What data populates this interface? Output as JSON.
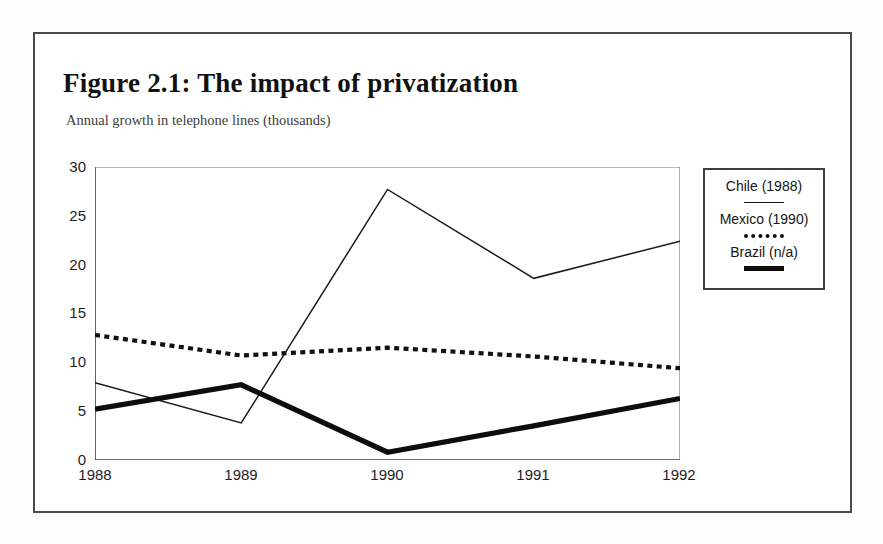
{
  "figure": {
    "title": "Figure 2.1:  The impact of privatization",
    "subtitle": "Annual growth in telephone lines (thousands)"
  },
  "legend": {
    "entries": [
      {
        "label": "Chile (1988)",
        "style": "thin-solid"
      },
      {
        "label": "Mexico (1990)",
        "style": "dotted"
      },
      {
        "label": "Brazil (n/a)",
        "style": "thick-solid"
      }
    ]
  },
  "axes": {
    "y_ticks": [
      "0",
      "5",
      "10",
      "15",
      "20",
      "25",
      "30"
    ],
    "x_ticks": [
      "1988",
      "1989",
      "1990",
      "1991",
      "1992"
    ]
  },
  "chart_data": {
    "type": "line",
    "title": "Figure 2.1:  The impact of privatization",
    "subtitle": "Annual growth in telephone lines (thousands)",
    "xlabel": "",
    "ylabel": "Annual growth in telephone lines (thousands)",
    "categories": [
      "1988",
      "1989",
      "1990",
      "1991",
      "1992"
    ],
    "x": [
      1988,
      1989,
      1990,
      1991,
      1992
    ],
    "ylim": [
      0,
      30
    ],
    "yticks": [
      0,
      5,
      10,
      15,
      20,
      25,
      30
    ],
    "grid": false,
    "legend_position": "right-outside",
    "series": [
      {
        "name": "Chile (1988)",
        "values": [
          7.9,
          3.8,
          27.7,
          18.6,
          22.4
        ],
        "line_style": "solid",
        "line_width": 1.4,
        "color": "#1a1a1a"
      },
      {
        "name": "Mexico (1990)",
        "values": [
          12.8,
          10.7,
          11.5,
          10.6,
          9.4
        ],
        "line_style": "dotted",
        "line_width": 4,
        "color": "#111111"
      },
      {
        "name": "Brazil (n/a)",
        "values": [
          5.2,
          7.7,
          0.8,
          3.5,
          6.3
        ],
        "line_style": "solid",
        "line_width": 5,
        "color": "#0d0d0d"
      }
    ]
  }
}
